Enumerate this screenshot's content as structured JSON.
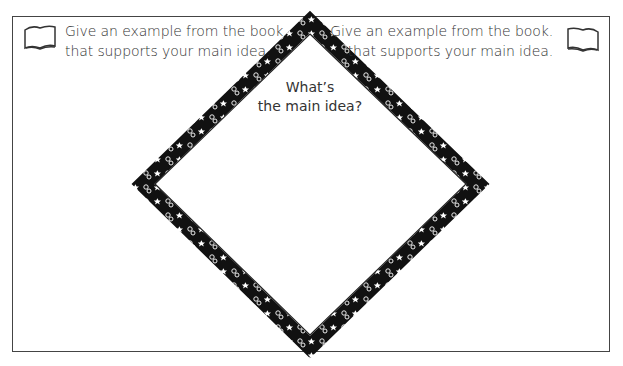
{
  "worksheet": {
    "left_prompt": {
      "line1": "Give an example from the book.",
      "line2": "that supports your main idea."
    },
    "right_prompt": {
      "line1": "Give an example from the book.",
      "line2": "that supports your main idea."
    },
    "center_question": {
      "line1": "What’s",
      "line2": "the main idea?"
    },
    "icons": [
      "book-icon",
      "book-icon"
    ],
    "colors": {
      "border": "#444444",
      "diamond_band": "#111111",
      "text": "#333333",
      "background": "#ffffff"
    }
  }
}
